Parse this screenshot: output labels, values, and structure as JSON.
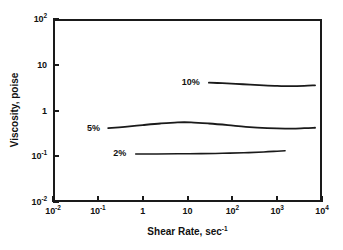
{
  "chart_data": {
    "type": "line",
    "title": "",
    "xlabel": "Shear Rate, sec-1",
    "xlabel_base": "Shear Rate, sec",
    "xlabel_sup": "-1",
    "ylabel": "Viscosity, poise",
    "xscale": "log",
    "yscale": "log",
    "xlim": [
      0.01,
      10000
    ],
    "ylim": [
      0.01,
      100
    ],
    "grid": false,
    "legend_position": "inline-annotations",
    "xticks": [
      {
        "value": 0.01,
        "base": "10",
        "sup": "-2"
      },
      {
        "value": 0.1,
        "base": "10",
        "sup": "-1"
      },
      {
        "value": 1,
        "base": "1",
        "sup": ""
      },
      {
        "value": 10,
        "base": "10",
        "sup": ""
      },
      {
        "value": 100,
        "base": "10",
        "sup": "2"
      },
      {
        "value": 1000,
        "base": "10",
        "sup": "3"
      },
      {
        "value": 10000,
        "base": "10",
        "sup": "4"
      }
    ],
    "yticks": [
      {
        "value": 100,
        "base": "10",
        "sup": "2"
      },
      {
        "value": 10,
        "base": "10",
        "sup": ""
      },
      {
        "value": 1,
        "base": "1",
        "sup": ""
      },
      {
        "value": 0.1,
        "base": "10",
        "sup": "-1"
      },
      {
        "value": 0.01,
        "base": "10",
        "sup": "-2"
      }
    ],
    "series": [
      {
        "name": "10%",
        "label": "10%",
        "color": "#1a1a1a",
        "linewidth": 1.8,
        "label_x": 22,
        "label_y": 4.2,
        "x": [
          30,
          60,
          120,
          250,
          500,
          1000,
          2000,
          4000,
          7000
        ],
        "y": [
          4.05,
          3.95,
          3.82,
          3.68,
          3.55,
          3.45,
          3.4,
          3.45,
          3.55
        ]
      },
      {
        "name": "5%",
        "label": "5%",
        "color": "#1a1a1a",
        "linewidth": 1.8,
        "label_x": 0.13,
        "label_y": 0.42,
        "x": [
          0.17,
          0.4,
          1,
          2.5,
          6,
          12,
          30,
          80,
          200,
          600,
          1500,
          4000,
          7000
        ],
        "y": [
          0.41,
          0.44,
          0.48,
          0.52,
          0.55,
          0.55,
          0.52,
          0.48,
          0.44,
          0.41,
          0.4,
          0.41,
          0.42
        ]
      },
      {
        "name": "2%",
        "label": "2%",
        "color": "#1a1a1a",
        "linewidth": 1.6,
        "label_x": 0.5,
        "label_y": 0.115,
        "x": [
          0.7,
          2,
          6,
          20,
          60,
          180,
          500,
          1000,
          1500
        ],
        "y": [
          0.112,
          0.112,
          0.113,
          0.114,
          0.116,
          0.119,
          0.124,
          0.129,
          0.132
        ]
      }
    ]
  }
}
